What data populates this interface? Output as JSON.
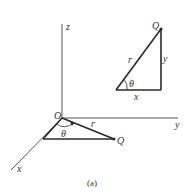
{
  "figure": {
    "caption": "(a)",
    "colors": {
      "line": "#2a2a2a",
      "axis": "#555555",
      "text": "#333333"
    }
  },
  "axes": {
    "origin_label": "O",
    "x_label": "x",
    "y_label": "y",
    "z_label": "z"
  },
  "lower_triangle": {
    "point_label": "Q",
    "hypotenuse_label": "r",
    "angle_label": "θ"
  },
  "upper_triangle": {
    "point_label": "Q",
    "hypotenuse_label": "r",
    "angle_label": "θ",
    "horizontal_label": "x",
    "vertical_label": "y"
  }
}
